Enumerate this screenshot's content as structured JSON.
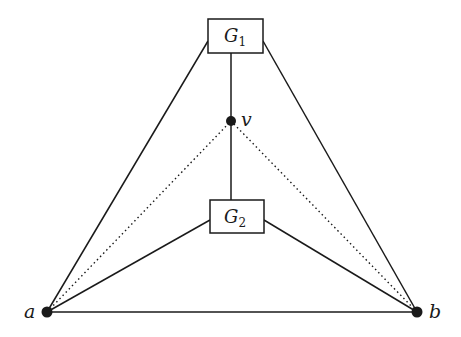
{
  "diagram": {
    "type": "graph",
    "colors": {
      "stroke": "#1a1a1a",
      "background": "#ffffff"
    },
    "vertices": [
      {
        "id": "a",
        "label": "a",
        "x": 47,
        "y": 312
      },
      {
        "id": "b",
        "label": "b",
        "x": 417,
        "y": 312
      },
      {
        "id": "v",
        "label": "v",
        "x": 231,
        "y": 121
      }
    ],
    "boxes": [
      {
        "id": "G1",
        "label": "G",
        "subscript": "1",
        "x": 208,
        "y": 19,
        "w": 55,
        "h": 34
      },
      {
        "id": "G2",
        "label": "G",
        "subscript": "2",
        "x": 210,
        "y": 200,
        "w": 54,
        "h": 33
      }
    ],
    "edges": [
      {
        "from": "a",
        "to": "b",
        "style": "solid"
      },
      {
        "from": "a",
        "to": "G1",
        "style": "solid"
      },
      {
        "from": "b",
        "to": "G1",
        "style": "solid"
      },
      {
        "from": "a",
        "to": "G2",
        "style": "solid"
      },
      {
        "from": "b",
        "to": "G2",
        "style": "solid"
      },
      {
        "from": "G1",
        "to": "v",
        "style": "solid"
      },
      {
        "from": "v",
        "to": "G2",
        "style": "solid"
      },
      {
        "from": "a",
        "to": "v",
        "style": "dotted"
      },
      {
        "from": "b",
        "to": "v",
        "style": "dotted"
      }
    ]
  }
}
